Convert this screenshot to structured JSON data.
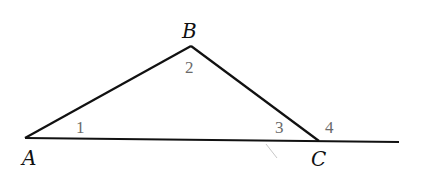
{
  "figure": {
    "vertices": {
      "A": {
        "label": "A",
        "x": 25,
        "y": 138
      },
      "B": {
        "label": "B",
        "x": 191,
        "y": 46
      },
      "C": {
        "label": "C",
        "x": 319,
        "y": 141
      }
    },
    "extension_end": {
      "x": 399,
      "y": 142
    },
    "angles": [
      {
        "label": "1",
        "at": "A"
      },
      {
        "label": "2",
        "at": "B"
      },
      {
        "label": "3",
        "at": "C (interior)"
      },
      {
        "label": "4",
        "at": "C (exterior)"
      }
    ],
    "colors": {
      "line": "#111111",
      "vertex_label": "#111111",
      "angle_label": "#6a6a6a"
    }
  }
}
